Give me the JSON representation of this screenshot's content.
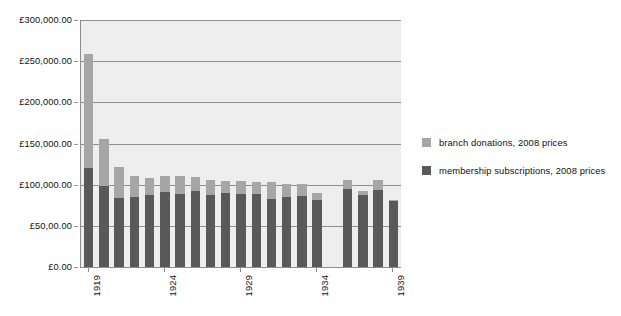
{
  "chart_data": {
    "type": "bar",
    "stacked": true,
    "title": "",
    "subtitle": "",
    "xlabel": "",
    "ylabel": "",
    "ylim": [
      0,
      300000
    ],
    "grid": true,
    "legend_position": "right",
    "currency_symbol": "£",
    "categories": [
      "1919",
      "1920",
      "1921",
      "1922",
      "1923",
      "1924",
      "1925",
      "1926",
      "1927",
      "1928",
      "1929",
      "1930",
      "1931",
      "1932",
      "1933",
      "1934",
      "1935",
      "1936",
      "1937",
      "1938",
      "1939"
    ],
    "x_tick_labels": [
      "1919",
      "1924",
      "1929",
      "1934",
      "1939"
    ],
    "y_tick_labels": [
      "£300,000.00",
      "£250,000.00",
      "£200,000.00",
      "£150,000.00",
      "£100,000.00",
      "£50,00.00",
      "£0.00"
    ],
    "y_tick_values": [
      300000,
      250000,
      200000,
      150000,
      100000,
      50000,
      0
    ],
    "series": [
      {
        "name": "membership subscriptions, 2008 prices",
        "color": "#595959",
        "values": [
          120000,
          99000,
          84000,
          85000,
          88000,
          91000,
          89000,
          92000,
          88000,
          90000,
          89000,
          89000,
          83000,
          85000,
          86000,
          82000,
          null,
          95000,
          88000,
          94000,
          80000
        ]
      },
      {
        "name": "branch donations, 2008 prices",
        "color": "#a6a6a6",
        "values": [
          139000,
          57000,
          38000,
          25000,
          20000,
          19000,
          22000,
          17000,
          18000,
          14000,
          16000,
          14000,
          20000,
          16000,
          15000,
          8000,
          null,
          11000,
          4000,
          12000,
          2000
        ]
      }
    ],
    "totals": [
      259000,
      156000,
      122000,
      110000,
      108000,
      110000,
      111000,
      109000,
      106000,
      104000,
      105000,
      103000,
      103000,
      101000,
      101000,
      90000,
      null,
      106000,
      92000,
      106000,
      82000
    ]
  },
  "legend": {
    "entries": [
      {
        "label": "branch donations, 2008 prices",
        "color": "#a6a6a6"
      },
      {
        "label": "membership subscriptions, 2008 prices",
        "color": "#595959"
      }
    ]
  }
}
